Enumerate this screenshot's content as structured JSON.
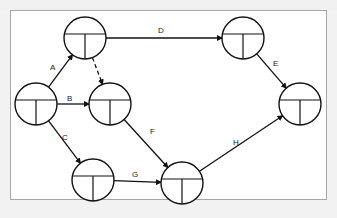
{
  "diagram": {
    "type": "activity-on-node network",
    "colors": {
      "line": "#111111",
      "background": "#ffffff",
      "frame": "#a6a6a6",
      "page": "#f2f2f2"
    },
    "nodes": [
      {
        "id": "n1"
      },
      {
        "id": "n2"
      },
      {
        "id": "n3"
      },
      {
        "id": "n4"
      },
      {
        "id": "n5"
      },
      {
        "id": "n6"
      },
      {
        "id": "n7"
      }
    ],
    "edges": [
      {
        "id": "A",
        "label": "A",
        "from": "n2",
        "to": "n1",
        "style": "solid"
      },
      {
        "id": "B",
        "label": "B",
        "from": "n2",
        "to": "n3",
        "style": "solid"
      },
      {
        "id": "C",
        "label": "C",
        "from": "n2",
        "to": "n4",
        "style": "solid"
      },
      {
        "id": "D",
        "label": "D",
        "from": "n1",
        "to": "n6",
        "style": "solid"
      },
      {
        "id": "dummy",
        "label": "",
        "from": "n1",
        "to": "n3",
        "style": "dashed"
      },
      {
        "id": "E",
        "label": "E",
        "from": "n6",
        "to": "n7",
        "style": "solid"
      },
      {
        "id": "F",
        "label": "F",
        "from": "n3",
        "to": "n5",
        "style": "solid"
      },
      {
        "id": "G",
        "label": "G",
        "from": "n4",
        "to": "n5",
        "style": "solid"
      },
      {
        "id": "H",
        "label": "H",
        "from": "n5",
        "to": "n7",
        "style": "solid"
      }
    ]
  }
}
